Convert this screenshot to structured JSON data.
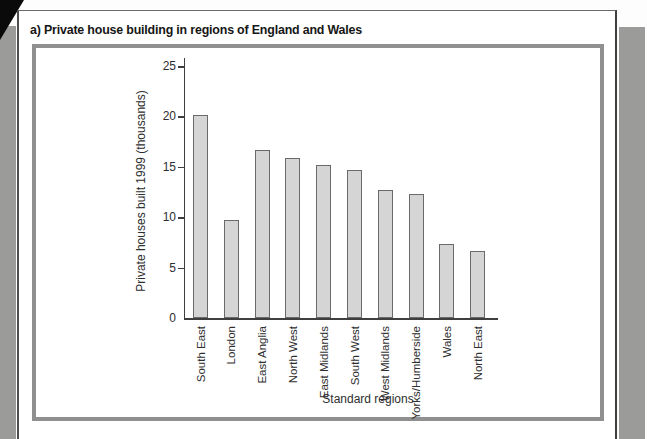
{
  "page": {
    "title": "a) Private house building in regions of England and Wales"
  },
  "chart_data": {
    "type": "bar",
    "categories": [
      "South East",
      "London",
      "East Anglia",
      "North West",
      "East Midlands",
      "South West",
      "West Midlands",
      "Yorks/Humberside",
      "Wales",
      "North East"
    ],
    "values": [
      20.1,
      9.7,
      16.7,
      15.9,
      15.2,
      14.7,
      12.7,
      12.3,
      7.3,
      6.6
    ],
    "title": "",
    "xlabel": "Standard regions",
    "ylabel": "Private houses built 1999 (thousands)",
    "ylim": [
      0,
      25
    ],
    "yticks": [
      0,
      5,
      10,
      15,
      20,
      25
    ],
    "grid": false,
    "legend": "none",
    "bar_fill": "#d5d5d5",
    "bar_border": "#6a6a6a",
    "axis_color": "#3f3f3f",
    "text_color": "#2e2e2e"
  },
  "scan": {
    "panel_border_color": "#909090",
    "margin_band_color": "#9b9b9a",
    "corner_wedge_color": "#0a0a0a"
  }
}
